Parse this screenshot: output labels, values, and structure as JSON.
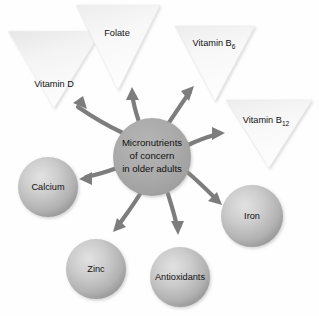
{
  "diagram": {
    "title": "Micronutrients of concern in older adults",
    "type": "radial-hub-and-spoke",
    "background_color": "#fefefe",
    "arrow_color": "#7d7d7d",
    "center": {
      "name": "center-node",
      "shape": "circle",
      "line1": "Micronutrients",
      "line2": "of concern",
      "line3": "in older adults",
      "fill_color": "#a9a9a9",
      "cx": 152,
      "cy": 157,
      "r": 39
    },
    "triangles": [
      {
        "id": "vitamin-d",
        "label": "Vitamin D",
        "base": "Vitamin D",
        "subscript": "",
        "shape": "inverted-triangle",
        "fill_color": "#fafafa",
        "label_x": 54,
        "label_y": 85,
        "points": "8,31 101,31 54,108"
      },
      {
        "id": "folate",
        "label": "Folate",
        "base": "Folate",
        "subscript": "",
        "shape": "inverted-triangle",
        "fill_color": "#f0f0f0",
        "label_x": 117,
        "label_y": 34,
        "points": "76,5 160,5 118,90"
      },
      {
        "id": "vitamin-b6",
        "label": "Vitamin B6",
        "base": "Vitamin B",
        "subscript": "6",
        "shape": "inverted-triangle",
        "fill_color": "#eeeeee",
        "label_x": 214,
        "label_y": 44,
        "points": "175,26 255,26 215,101"
      },
      {
        "id": "vitamin-b12",
        "label": "Vitamin B12",
        "base": "Vitamin B",
        "subscript": "12",
        "shape": "inverted-triangle",
        "fill_color": "#ececec",
        "label_x": 268,
        "label_y": 121,
        "points": "226,100 312,100 269,168"
      }
    ],
    "circles": [
      {
        "id": "calcium",
        "label": "Calcium",
        "shape": "circle",
        "fill_color": "#b9b9b9",
        "cx": 48,
        "cy": 187,
        "r": 30
      },
      {
        "id": "zinc",
        "label": "Zinc",
        "shape": "circle",
        "fill_color": "#b9b9b9",
        "cx": 96,
        "cy": 269,
        "r": 30
      },
      {
        "id": "antioxidants",
        "label": "Antioxidants",
        "shape": "circle",
        "fill_color": "#b9b9b9",
        "cx": 180,
        "cy": 277,
        "r": 30
      },
      {
        "id": "iron",
        "label": "Iron",
        "shape": "circle",
        "fill_color": "#b9b9b9",
        "cx": 252,
        "cy": 216,
        "r": 31
      }
    ],
    "arrows": [
      {
        "id": "arrow-to-vitamin-d",
        "target": "vitamin-d",
        "path": "M 123 133 C 106 125 92 117 75 106",
        "head": "M 75 106 L 87 109 L 82 97 Z"
      },
      {
        "id": "arrow-to-folate",
        "target": "folate",
        "path": "M 141 121 C 136 110 134 103 133 90",
        "head": "M 133 90 L 127 101 L 139 101 Z"
      },
      {
        "id": "arrow-to-vitamin-b6",
        "target": "vitamin-b6",
        "path": "M 168 122 C 177 109 183 100 192 89",
        "head": "M 192 89 L 180 93 L 187 103 Z"
      },
      {
        "id": "arrow-to-vitamin-b12",
        "target": "vitamin-b12",
        "path": "M 186 146 C 198 140 208 137 222 134",
        "head": "M 222 134 L 210 128 L 210 141 Z"
      },
      {
        "id": "arrow-to-iron",
        "target": "iron",
        "path": "M 186 170 C 199 180 209 190 221 202",
        "head": "M 221 202 L 216 190 L 208 199 Z"
      },
      {
        "id": "arrow-to-calcium",
        "target": "calcium",
        "path": "M 117 168 C 105 172 95 175 82 178",
        "head": "M 82 178 L 94 184 L 94 172 Z"
      },
      {
        "id": "arrow-to-zinc",
        "target": "zinc",
        "path": "M 140 194 C 131 208 124 217 114 230",
        "head": "M 114 230 L 125 224 L 116 217 Z"
      },
      {
        "id": "arrow-to-antioxidants",
        "target": "antioxidants",
        "path": "M 168 194 C 172 208 175 218 178 233",
        "head": "M 178 233 L 184 222 L 172 222 Z"
      }
    ]
  }
}
